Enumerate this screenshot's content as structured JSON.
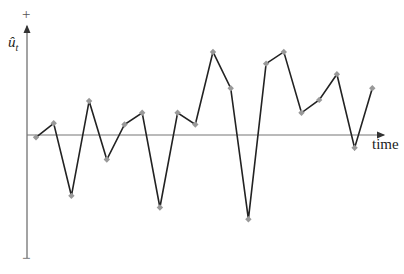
{
  "chart_data": {
    "type": "line",
    "title": "",
    "xlabel": "time",
    "ylabel": "û_t",
    "y_axis_top_sign": "+",
    "y_axis_bottom_sign": "−",
    "grid": false,
    "legend": null,
    "x": [
      1,
      2,
      3,
      4,
      5,
      6,
      7,
      8,
      9,
      10,
      11,
      12,
      13,
      14,
      15,
      16,
      17,
      18,
      19,
      20
    ],
    "values": [
      -0.2,
      1.0,
      -5.2,
      2.9,
      -2.1,
      0.9,
      1.9,
      -6.2,
      1.9,
      0.9,
      7.1,
      4.0,
      -7.2,
      6.1,
      7.1,
      1.9,
      3.0,
      5.2,
      -1.1,
      4.0
    ],
    "ylim": [
      -10,
      10
    ],
    "colors": {
      "line": "#222222",
      "marker": "#999999",
      "axis": "#555555"
    }
  },
  "labels": {
    "ylabel_main": "û",
    "ylabel_sub": "t",
    "xlabel": "time",
    "plus": "+",
    "minus": "−"
  }
}
